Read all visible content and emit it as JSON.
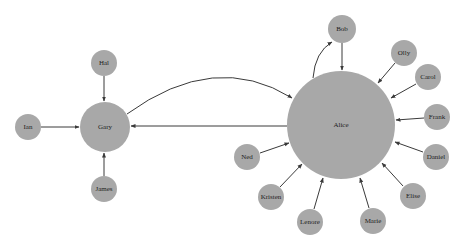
{
  "diagram": {
    "type": "directed-graph",
    "colors": {
      "node_fill": "#a8a8a8",
      "edge": "#3a3a3a",
      "label": "#222222",
      "background": "#ffffff"
    },
    "nodes": [
      {
        "id": "alice",
        "label": "Alice",
        "x": 341,
        "y": 125,
        "r": 54
      },
      {
        "id": "gary",
        "label": "Gary",
        "x": 105,
        "y": 127,
        "r": 25
      },
      {
        "id": "hal",
        "label": "Hal",
        "x": 104,
        "y": 63,
        "r": 13
      },
      {
        "id": "ian",
        "label": "Ian",
        "x": 28,
        "y": 127,
        "r": 13
      },
      {
        "id": "james",
        "label": "James",
        "x": 104,
        "y": 189,
        "r": 13
      },
      {
        "id": "bob",
        "label": "Bob",
        "x": 342,
        "y": 29,
        "r": 14
      },
      {
        "id": "olly",
        "label": "Olly",
        "x": 404,
        "y": 53,
        "r": 13
      },
      {
        "id": "carol",
        "label": "Carol",
        "x": 428,
        "y": 77,
        "r": 13
      },
      {
        "id": "frank",
        "label": "Frank",
        "x": 437,
        "y": 117,
        "r": 13
      },
      {
        "id": "daniel",
        "label": "Daniel",
        "x": 436,
        "y": 157,
        "r": 13
      },
      {
        "id": "elise",
        "label": "Elise",
        "x": 413,
        "y": 196,
        "r": 13
      },
      {
        "id": "marie",
        "label": "Marie",
        "x": 373,
        "y": 221,
        "r": 13
      },
      {
        "id": "lenore",
        "label": "Lenore",
        "x": 310,
        "y": 222,
        "r": 13
      },
      {
        "id": "kristen",
        "label": "Kristen",
        "x": 271,
        "y": 197,
        "r": 13
      },
      {
        "id": "ned",
        "label": "Ned",
        "x": 247,
        "y": 157,
        "r": 13
      }
    ],
    "edges": [
      {
        "from": "Hal",
        "to": "Gary"
      },
      {
        "from": "Ian",
        "to": "Gary"
      },
      {
        "from": "James",
        "to": "Gary"
      },
      {
        "from": "Gary",
        "to": "Alice",
        "curved": true
      },
      {
        "from": "Alice",
        "to": "Gary"
      },
      {
        "from": "Bob",
        "to": "Alice"
      },
      {
        "from": "Alice",
        "to": "Bob",
        "curved": true
      },
      {
        "from": "Olly",
        "to": "Alice"
      },
      {
        "from": "Carol",
        "to": "Alice"
      },
      {
        "from": "Frank",
        "to": "Alice"
      },
      {
        "from": "Daniel",
        "to": "Alice"
      },
      {
        "from": "Elise",
        "to": "Alice"
      },
      {
        "from": "Marie",
        "to": "Alice"
      },
      {
        "from": "Lenore",
        "to": "Alice"
      },
      {
        "from": "Kristen",
        "to": "Alice"
      },
      {
        "from": "Ned",
        "to": "Alice"
      }
    ]
  }
}
